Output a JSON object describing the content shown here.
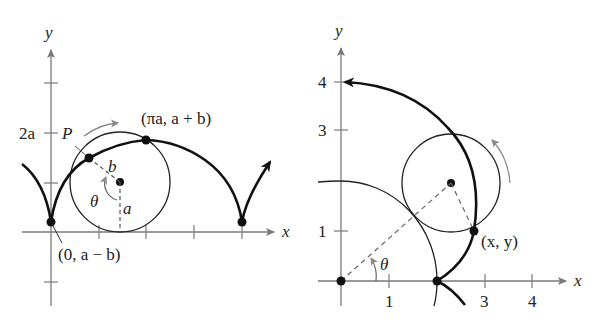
{
  "left_figure": {
    "axis_x_label": "x",
    "axis_y_label": "y",
    "tick_label_2a": "2a",
    "point_P_label": "P",
    "label_b": "b",
    "label_a": "a",
    "label_theta": "θ",
    "top_point_label": "(πa, a + b)",
    "start_point_label": "(0, a − b)"
  },
  "right_figure": {
    "axis_x_label": "x",
    "axis_y_label": "y",
    "x_tick_labels": [
      "1",
      "3",
      "4"
    ],
    "y_tick_labels": [
      "1",
      "3",
      "4"
    ],
    "label_theta": "θ",
    "point_label": "(x, y)"
  },
  "colors": {
    "curve": "#111111",
    "axis": "#7a7a7a",
    "arrow_gray": "#8a8a8a"
  }
}
